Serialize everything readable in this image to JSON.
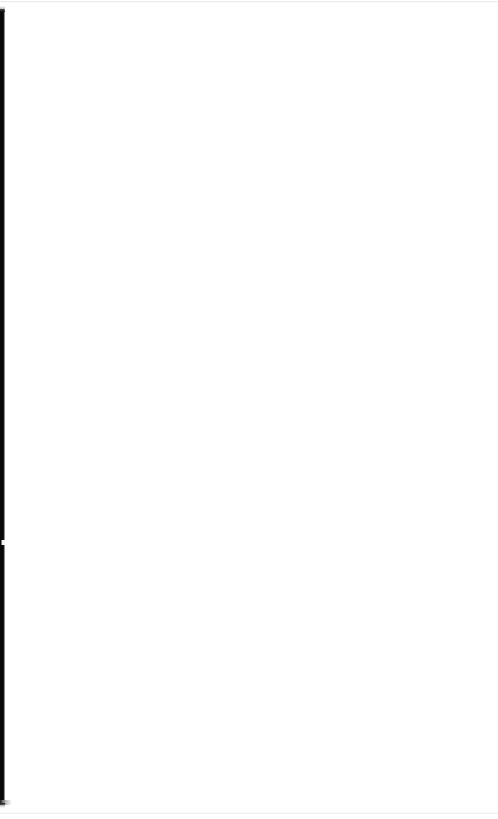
{
  "document": {
    "page_state": "blank",
    "background_color": "#ffffff",
    "width_px": 498,
    "height_px": 819,
    "content_text": "",
    "visible_text_elements": []
  },
  "left_edge_band": {
    "name": "left-edge-band",
    "color": "#060606",
    "edge_highlight_color": "#8d8d8d",
    "top_px": 9,
    "bottom_px": 804,
    "width_px": 5,
    "notch": {
      "name": "band-notch",
      "color": "#efefef",
      "top_px": 540,
      "height_px": 5
    },
    "foot_spur": {
      "name": "band-foot-spur",
      "color": "#6d6d6d",
      "top_px": 800,
      "width_px": 12
    }
  },
  "edge_rules": {
    "top": {
      "name": "edge-rule-top",
      "color": "#cccccc",
      "top_px": 1,
      "height_px": 2
    },
    "bottom": {
      "name": "edge-rule-bottom",
      "color": "#d1d1d1",
      "top_px": 812,
      "height_px": 2
    }
  }
}
